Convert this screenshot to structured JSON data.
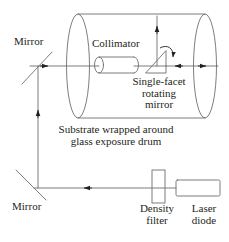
{
  "diagram": {
    "labels": {
      "mirror_top": "Mirror",
      "collimator": "Collimator",
      "rotating_mirror_line1": "Single-facet",
      "rotating_mirror_line2": "rotating",
      "rotating_mirror_line3": "mirror",
      "substrate_line1": "Substrate wrapped around",
      "substrate_line2": "glass exposure drum",
      "mirror_bottom": "Mirror",
      "density_filter_line1": "Density",
      "density_filter_line2": "filter",
      "laser_diode_line1": "Laser",
      "laser_diode_line2": "diode"
    },
    "colors": {
      "stroke": "#6d6e71",
      "text": "#231f20",
      "arrow": "#231f20",
      "background": "#ffffff"
    },
    "components": [
      {
        "name": "mirror-top",
        "type": "flat-mirror",
        "orientation": "up-right"
      },
      {
        "name": "collimator",
        "type": "cylinder-lens"
      },
      {
        "name": "rotating-mirror",
        "type": "right-triangle",
        "motion": "rotating"
      },
      {
        "name": "exposure-drum",
        "type": "cylinder"
      },
      {
        "name": "mirror-bottom",
        "type": "flat-mirror",
        "orientation": "down-right"
      },
      {
        "name": "density-filter",
        "type": "rectangle-vertical"
      },
      {
        "name": "laser-diode",
        "type": "rectangle-horizontal"
      }
    ],
    "beam_path": [
      {
        "from": "laser-diode",
        "to": "density-filter",
        "direction": "left"
      },
      {
        "from": "density-filter",
        "to": "mirror-bottom",
        "direction": "left"
      },
      {
        "from": "mirror-bottom",
        "to": "mirror-top",
        "direction": "up"
      },
      {
        "from": "mirror-top",
        "to": "collimator",
        "direction": "right"
      },
      {
        "from": "collimator",
        "to": "rotating-mirror",
        "direction": "right"
      },
      {
        "from": "rotating-mirror",
        "to": "drum-surface-top",
        "direction": "up"
      },
      {
        "from": "rotating-mirror",
        "to": "drum-surface-right",
        "direction": "right"
      }
    ]
  }
}
